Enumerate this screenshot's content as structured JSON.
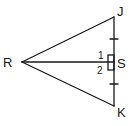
{
  "diagram": {
    "type": "geometry-figure",
    "stroke_color": "#1a1a1a",
    "background": "#ffffff",
    "points": {
      "R": {
        "label": "R",
        "x": 22,
        "y": 62
      },
      "J": {
        "label": "J",
        "x": 114,
        "y": 17
      },
      "K": {
        "label": "K",
        "x": 114,
        "y": 106
      },
      "S": {
        "label": "S",
        "x": 114,
        "y": 62
      }
    },
    "segments": [
      "RJ",
      "RK",
      "JK",
      "RS"
    ],
    "angle_labels": {
      "angle1": "1",
      "angle2": "2"
    },
    "tick_marks": [
      "JS",
      "SK"
    ],
    "right_angle_at": "S"
  }
}
